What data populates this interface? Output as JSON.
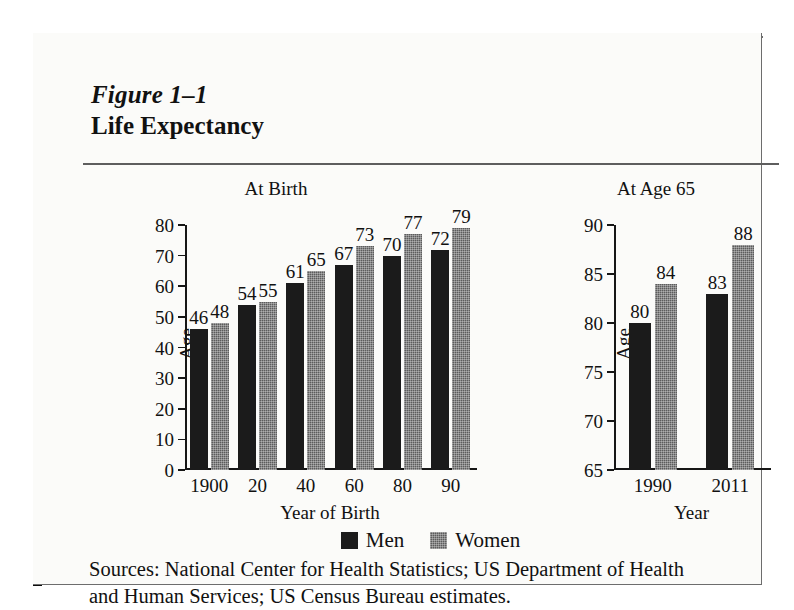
{
  "figure": {
    "number": "Figure 1–1",
    "title": "Life Expectancy",
    "sources_line1": "Sources:  National Center for Health Statistics; US Department of Health",
    "sources_line2": "and Human Services; US Census Bureau estimates."
  },
  "legend": {
    "position": "bottom-center",
    "items": [
      {
        "label": "Men",
        "color": "#1b1b1b",
        "swatch": "solid-black-swatch"
      },
      {
        "label": "Women",
        "color": "#5c5c5c",
        "swatch": "dithered-gray-swatch"
      }
    ]
  },
  "chart_data": [
    {
      "type": "bar",
      "id": "at-birth",
      "title": "At Birth",
      "xlabel": "Year of Birth",
      "ylabel": "Age",
      "ylim": [
        0,
        80
      ],
      "yticks": [
        0,
        10,
        20,
        30,
        40,
        50,
        60,
        70,
        80
      ],
      "grid": false,
      "categories": [
        "1900",
        "20",
        "40",
        "60",
        "80",
        "90"
      ],
      "series": [
        {
          "name": "Men",
          "values": [
            46,
            54,
            61,
            67,
            70,
            72
          ]
        },
        {
          "name": "Women",
          "values": [
            48,
            55,
            65,
            73,
            77,
            79
          ]
        }
      ]
    },
    {
      "type": "bar",
      "id": "at-age-65",
      "title": "At Age 65",
      "xlabel": "Year",
      "ylabel": "Age",
      "ylim": [
        65,
        90
      ],
      "yticks": [
        65,
        70,
        75,
        80,
        85,
        90
      ],
      "grid": false,
      "categories": [
        "1990",
        "2011"
      ],
      "series": [
        {
          "name": "Men",
          "values": [
            80,
            83
          ]
        },
        {
          "name": "Women",
          "values": [
            84,
            88
          ]
        }
      ]
    }
  ]
}
